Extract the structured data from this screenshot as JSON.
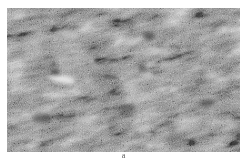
{
  "figure": {
    "caption": "a",
    "image": {
      "description": "grayscale micrograph of rough textured surface with diagonal streaks and scattered bright spots",
      "tone": "grayscale",
      "colors": {
        "background": "#ffffff",
        "mid_gray": "#7a7a7a",
        "dark": "#3a3a3a",
        "bright": "#e6e6e6"
      }
    }
  }
}
